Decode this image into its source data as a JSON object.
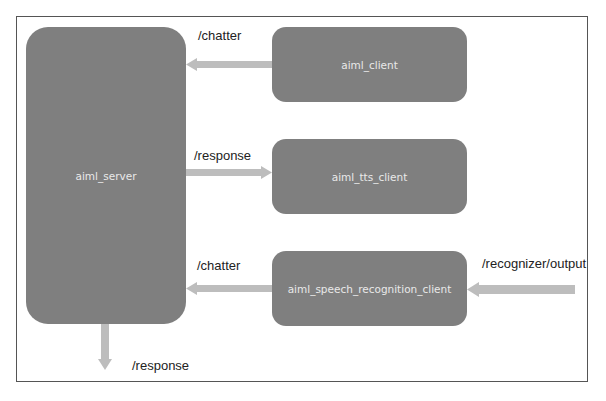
{
  "diagram": {
    "colors": {
      "node_fill": "#7f7f7f",
      "node_text": "#e9e9e9",
      "arrow": "#bdbdbd",
      "frame": "#555555",
      "label_text": "#222222"
    },
    "nodes": [
      {
        "id": "aiml_server",
        "label": "aiml_server"
      },
      {
        "id": "aiml_client",
        "label": "aiml_client"
      },
      {
        "id": "aiml_tts_client",
        "label": "aiml_tts_client"
      },
      {
        "id": "aiml_speech_recognition_client",
        "label": "aiml_speech_recognition_client"
      }
    ],
    "edges": [
      {
        "from": "aiml_client",
        "to": "aiml_server",
        "label": "/chatter"
      },
      {
        "from": "aiml_server",
        "to": "aiml_tts_client",
        "label": "/response"
      },
      {
        "from": "aiml_speech_recognition_client",
        "to": "aiml_server",
        "label": "/chatter"
      },
      {
        "from": "external",
        "to": "aiml_speech_recognition_client",
        "label": "/recognizer/output"
      },
      {
        "from": "aiml_server",
        "to": "external",
        "label": "/response"
      }
    ]
  }
}
